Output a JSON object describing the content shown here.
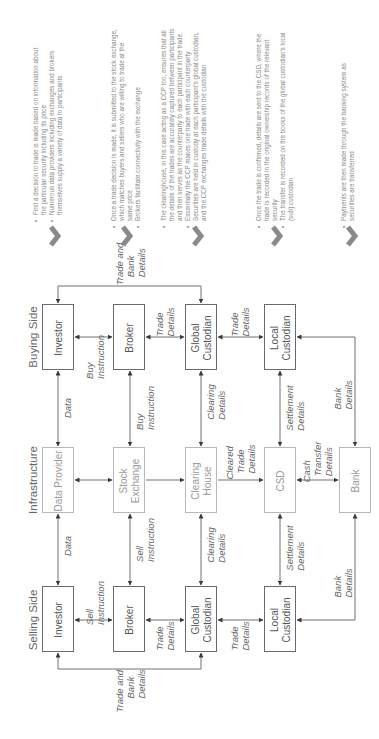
{
  "columns": {
    "selling_side": "Selling Side",
    "infrastructure": "Infrastructure",
    "buying_side": "Buying Side"
  },
  "buying_side": {
    "investor": "Investor",
    "broker": "Broker",
    "global_custodian": [
      "Global",
      "Custodian"
    ],
    "local_custodian": [
      "Local",
      "Custodian"
    ]
  },
  "infrastructure": {
    "data_provider": "Data Provider",
    "stock_exchange": [
      "Stock",
      "Exchange"
    ],
    "clearing_house": [
      "Clearing",
      "House"
    ],
    "csd": "CSD",
    "bank": "Bank"
  },
  "selling_side": {
    "investor": "Investor",
    "broker": "Broker",
    "global_custodian": [
      "Global",
      "Custodian"
    ],
    "local_custodian": [
      "Local",
      "Custodian"
    ]
  },
  "edge_labels": {
    "buy_trade_and_bank": [
      "Trade and",
      "Bank",
      "Details"
    ],
    "buy_instruction": [
      "Buy",
      "Instruction"
    ],
    "buy_broker_gc_trade": [
      "Trade",
      "Details"
    ],
    "buy_gc_lc_trade": [
      "Trade",
      "Details"
    ],
    "buy_data": "Data",
    "buy_instruction_to_exchange": [
      "Buy",
      "Instruction"
    ],
    "buy_clearing_details": [
      "Clearing",
      "Details"
    ],
    "buy_settlement_details": [
      "Settlement",
      "Details"
    ],
    "buy_bank_details": [
      "Bank",
      "Details"
    ],
    "cleared_trade_details": [
      "Cleared",
      "Trade",
      "Details"
    ],
    "cash_transfer_details": [
      "Cash",
      "Transfer",
      "Details"
    ],
    "sell_data": "Data",
    "sell_instruction_to_exchange": [
      "Sell",
      "Instruction"
    ],
    "sell_clearing_details": [
      "Clearing",
      "Details"
    ],
    "sell_settlement_details": [
      "Settlement",
      "Details"
    ],
    "sell_bank_details": [
      "Bank",
      "Details"
    ],
    "sell_instruction": [
      "Sell",
      "Instruction"
    ],
    "sell_broker_gc_trade": [
      "Trade",
      "Details"
    ],
    "sell_gc_lc_trade": [
      "Trade",
      "Details"
    ],
    "sell_trade_and_bank": [
      "Trade and",
      "Bank",
      "Details"
    ]
  },
  "descriptions": [
    {
      "bullets": [
        "First a decision to trade is made based on information about the particular security including its price",
        "Numerous data providers including exchanges and brokers themselves supply a variety of data to participants"
      ]
    },
    {
      "bullets": [
        "Once a trade decision is made, it is submitted to the stock exchange, which matches buyers and sellers who are willing to trade at the same price",
        "Brokers facilitate connectivity with the exchange"
      ]
    },
    {
      "bullets": [
        "The clearinghouse, in this case acting as a CCP too, ensures that all the details of the trades are accurately captured between participants and then serves as the counterparty to each participant in the trade",
        "Essentially the CCP makes one trade with each counterparty",
        "Securities are held in custody at each participant's global custodian, and the CCP exchanges trade details with the custodian"
      ]
    },
    {
      "bullets": [
        "Once the trade is confirmed, details are sent to the CSD, where the trade is recorded in the original ownership records of the relevant security",
        "The transfer is recorded on the books of the global custodian's local (sub) custodian"
      ]
    },
    {
      "bullets": [
        "Payments are then made through the banking system as securities are transferred"
      ]
    }
  ],
  "icons": {
    "step_chevron": "chevron-down-icon"
  },
  "colors": {
    "dark_border": "#6a6a6a",
    "light_border": "#b8b8b8",
    "line": "#6a6a6a",
    "chevron": "#8a8a8a",
    "text": "#666666"
  }
}
